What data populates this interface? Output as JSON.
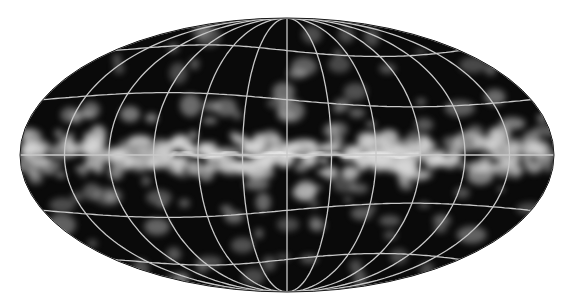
{
  "figure": {
    "projection": "mollweide",
    "grid": {
      "meridian_step_deg": 30,
      "parallels_deg": [
        -60,
        -30,
        0,
        30,
        60
      ]
    },
    "colors": {
      "background": "#ffffff",
      "sky": "#0a0a0a",
      "emission": "#d8d8d8",
      "grid": "#c8c8c8"
    }
  }
}
